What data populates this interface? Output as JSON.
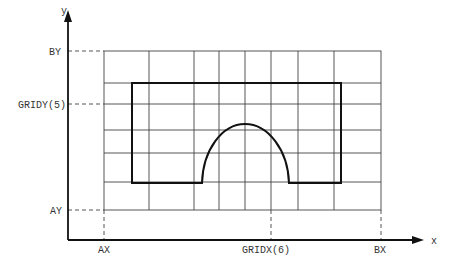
{
  "diagram": {
    "axes": {
      "x_label": "x",
      "y_label": "y"
    },
    "x_markers": [
      {
        "label": "AX",
        "x": 104
      },
      {
        "label": "GRIDX(6)",
        "x": 271
      },
      {
        "label": "BX",
        "x": 381
      }
    ],
    "y_markers": [
      {
        "label": "BY",
        "y": 51
      },
      {
        "label": "GRIDY(5)",
        "y": 104
      },
      {
        "label": "AY",
        "y": 210
      }
    ],
    "grid": {
      "vertical_lines_x": [
        104,
        149,
        194,
        219,
        245,
        271,
        298,
        334,
        381
      ],
      "horizontal_lines_y": [
        51,
        83,
        104,
        130,
        153,
        182,
        210
      ]
    },
    "shape": {
      "description": "Closed outline: rectangle with an arch-shaped notch along the bottom edge",
      "rect": {
        "left": 132,
        "top": 83,
        "right": 341,
        "bottom": 183
      },
      "arch": {
        "start_x": 202,
        "peak_x": 245,
        "peak_y": 124,
        "end_x": 289,
        "base_y": 182
      }
    }
  }
}
